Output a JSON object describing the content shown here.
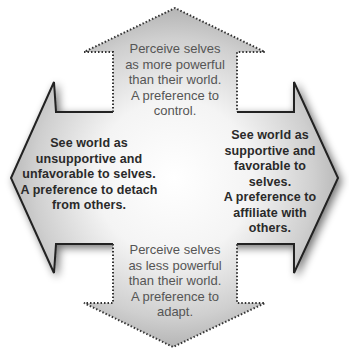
{
  "diagram": {
    "type": "four-way arrow (cross of two double-headed arrows)",
    "colors": {
      "fill_center": "#ffffff",
      "fill_edge": "#b4b4b4",
      "horizontal_border": "#222222",
      "vertical_border": "#333333",
      "vertical_text": "#555555",
      "horizontal_text": "#2a2a2a"
    },
    "arrows": {
      "up": {
        "direction": "up",
        "lines": [
          "Perceive selves",
          "as more powerful",
          "than their world.",
          "A preference to",
          "control."
        ]
      },
      "down": {
        "direction": "down",
        "lines": [
          "Perceive selves",
          "as less powerful",
          "than their world.",
          "A preference to",
          "adapt."
        ]
      },
      "left": {
        "direction": "left",
        "lines": [
          "See world as",
          "unsupportive and",
          "unfavorable to selves.",
          "A preference to detach",
          "from others."
        ]
      },
      "right": {
        "direction": "right",
        "lines": [
          "See world as",
          "supportive and",
          "favorable to selves.",
          "A preference to",
          "affiliate with",
          "others."
        ]
      }
    }
  }
}
